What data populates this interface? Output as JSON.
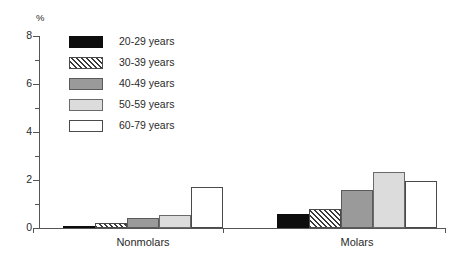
{
  "chart_data": {
    "type": "bar",
    "title": "",
    "xlabel": "",
    "ylabel": "%",
    "ylim": [
      0,
      8
    ],
    "yticks": [
      0,
      1,
      2,
      3,
      4,
      5,
      6,
      7,
      8
    ],
    "ytick_labels": [
      "0",
      "",
      "2",
      "",
      "4",
      "",
      "6",
      "",
      "8"
    ],
    "ytick_major_labels": [
      "0",
      "2",
      "4",
      "6",
      "8"
    ],
    "grid": false,
    "legend_position": "upper-left-inside",
    "categories": [
      "Nonmolars",
      "Molars"
    ],
    "series": [
      {
        "name": "20-29 years",
        "color": "#0d0d0d",
        "fill": "solid",
        "values": [
          0.05,
          0.6
        ]
      },
      {
        "name": "30-39 years",
        "color": "#3a3a3a",
        "fill": "hatch",
        "values": [
          0.2,
          0.8
        ]
      },
      {
        "name": "40-49 years",
        "color": "#9a9a9a",
        "fill": "solid",
        "values": [
          0.4,
          1.6
        ]
      },
      {
        "name": "50-59 years",
        "color": "#dcdcdc",
        "fill": "solid",
        "values": [
          0.55,
          2.35
        ]
      },
      {
        "name": "60-79 years",
        "color": "#ffffff",
        "fill": "solid",
        "values": [
          1.7,
          1.95
        ]
      }
    ]
  },
  "axis": {
    "unit_label": "%",
    "tick_0": "0",
    "tick_2": "2",
    "tick_4": "4",
    "tick_6": "6",
    "tick_8": "8"
  },
  "groups": {
    "nonmolars_label": "Nonmolars",
    "molars_label": "Molars"
  },
  "legend": {
    "items": [
      {
        "label": "20-29 years"
      },
      {
        "label": "30-39 years"
      },
      {
        "label": "40-49 years"
      },
      {
        "label": "50-59 years"
      },
      {
        "label": "60-79 years"
      }
    ]
  }
}
